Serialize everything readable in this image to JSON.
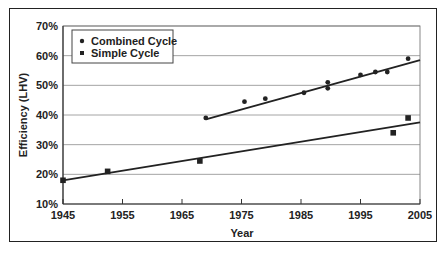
{
  "chart_data": {
    "type": "scatter",
    "title": "",
    "xlabel": "Year",
    "ylabel": "Efficiency (LHV)",
    "xlim": [
      1945,
      2005
    ],
    "ylim": [
      10,
      70
    ],
    "x_ticks": [
      "1945",
      "1955",
      "1965",
      "1975",
      "1985",
      "1995",
      "2005"
    ],
    "y_ticks": [
      "10%",
      "20%",
      "30%",
      "40%",
      "50%",
      "60%",
      "70%"
    ],
    "grid": "horizontal",
    "legend_position": "upper-left",
    "series": [
      {
        "name": "Combined Cycle",
        "marker": "circle",
        "color": "#222222",
        "points": [
          {
            "x": 1969,
            "y": 39
          },
          {
            "x": 1975.5,
            "y": 44.5
          },
          {
            "x": 1979,
            "y": 45.5
          },
          {
            "x": 1985.5,
            "y": 47.5
          },
          {
            "x": 1989.5,
            "y": 51
          },
          {
            "x": 1989.5,
            "y": 49
          },
          {
            "x": 1995,
            "y": 53.5
          },
          {
            "x": 1997.5,
            "y": 54.5
          },
          {
            "x": 1999.5,
            "y": 54.5
          },
          {
            "x": 2003,
            "y": 59
          }
        ],
        "trendline": {
          "x": [
            1969,
            2005
          ],
          "y": [
            38.5,
            58.5
          ]
        }
      },
      {
        "name": "Simple Cycle",
        "marker": "square",
        "color": "#222222",
        "points": [
          {
            "x": 1945,
            "y": 18
          },
          {
            "x": 1952.5,
            "y": 21
          },
          {
            "x": 1968,
            "y": 24.5
          },
          {
            "x": 2000.5,
            "y": 34
          },
          {
            "x": 2003,
            "y": 39
          }
        ],
        "trendline": {
          "x": [
            1945,
            2005
          ],
          "y": [
            18,
            37.5
          ]
        }
      }
    ]
  },
  "legend": {
    "items": [
      {
        "label": "Combined Cycle",
        "marker": "circle"
      },
      {
        "label": "Simple Cycle",
        "marker": "square"
      }
    ]
  },
  "axes": {
    "xlabel": "Year",
    "ylabel": "Efficiency (LHV)"
  }
}
